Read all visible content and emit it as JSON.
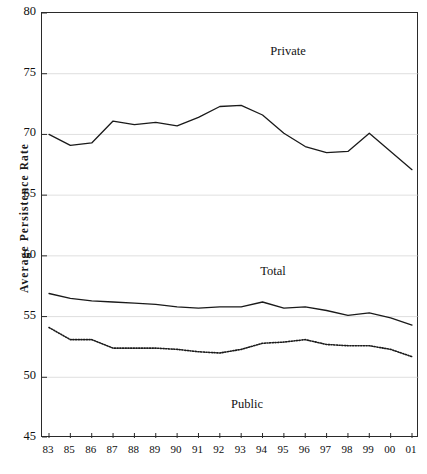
{
  "chart_data": {
    "type": "line",
    "title": "",
    "xlabel": "",
    "ylabel": "Average Persistence Rate",
    "ylim": [
      45,
      80
    ],
    "yticks": [
      45,
      50,
      55,
      60,
      65,
      70,
      75,
      80
    ],
    "grid": true,
    "grid_axis": "y",
    "legend_position": "inline-annotations",
    "categories": [
      "83",
      "85",
      "86",
      "87",
      "88",
      "89",
      "90",
      "91",
      "92",
      "93",
      "94",
      "95",
      "96",
      "97",
      "98",
      "99",
      "00",
      "01"
    ],
    "series": [
      {
        "name": "Private",
        "label": "Private",
        "style": "solid",
        "color": "#1a1a1a",
        "values": [
          70.0,
          69.1,
          69.3,
          71.1,
          70.8,
          71.0,
          70.7,
          71.4,
          72.3,
          72.4,
          71.6,
          70.1,
          69.0,
          68.5,
          68.6,
          70.1,
          68.6,
          67.1
        ]
      },
      {
        "name": "Total",
        "label": "Total",
        "style": "solid",
        "color": "#1a1a1a",
        "values": [
          56.9,
          56.5,
          56.3,
          56.2,
          56.1,
          56.0,
          55.8,
          55.7,
          55.8,
          55.8,
          56.2,
          55.7,
          55.8,
          55.5,
          55.1,
          55.3,
          54.9,
          54.3
        ]
      },
      {
        "name": "Public",
        "label": "Public",
        "style": "dotted",
        "color": "#1a1a1a",
        "values": [
          54.1,
          53.1,
          53.1,
          52.4,
          52.4,
          52.4,
          52.3,
          52.1,
          52.0,
          52.3,
          52.8,
          52.9,
          53.1,
          52.7,
          52.6,
          52.6,
          52.3,
          51.7
        ]
      }
    ]
  },
  "annotations": {
    "private": "Private",
    "total": "Total",
    "public": "Public"
  }
}
